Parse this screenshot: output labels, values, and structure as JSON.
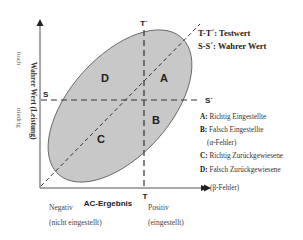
{
  "diagram": {
    "colors": {
      "ellipse_fill": "#c8c8c8",
      "ellipse_stroke": "#555555",
      "line": "#333333",
      "text": "#222222"
    },
    "lines": {
      "t_top_label": "T´",
      "t_bottom_label": "T",
      "s_left_label": "S",
      "s_right_label": "S´"
    },
    "regions": {
      "a": "A",
      "b": "B",
      "c": "C",
      "d": "D"
    },
    "key": {
      "tt": "T-T´: Testwert",
      "ss": "S-S´: Wahrer Wert"
    },
    "legend": [
      {
        "letter": "A:",
        "text": " Richtig Eingestellte"
      },
      {
        "letter": "B:",
        "text": " Falsch Eingestellte"
      },
      {
        "letter": "",
        "text": "(α-Fehler)"
      },
      {
        "letter": "C:",
        "text": " Richtig Zurückgewiesene"
      },
      {
        "letter": "D:",
        "text": " Falsch Zurückgewiesene"
      },
      {
        "letter": "",
        "text": "(β-Fehler)"
      }
    ],
    "y_axis": {
      "title": "Wahrer Wert (Leistung)",
      "high": "hoch",
      "low": "niedrig"
    },
    "x_axis": {
      "title": "AC-Ergebnis",
      "negative": "Negativ",
      "negative_sub": "(nicht eingestellt)",
      "positive": "Positiv",
      "positive_sub": "(eingestellt)"
    }
  }
}
